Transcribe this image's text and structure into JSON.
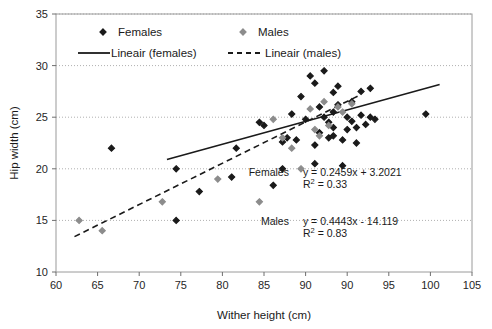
{
  "chart_data": {
    "type": "scatter",
    "title": "",
    "xlabel": "Wither height (cm)",
    "ylabel": "Hip width (cm)",
    "xlim": [
      60,
      105
    ],
    "ylim": [
      10,
      35
    ],
    "xticks": [
      60,
      65,
      70,
      75,
      80,
      85,
      90,
      90,
      95,
      100,
      105
    ],
    "yticks": [
      10,
      15,
      20,
      25,
      30,
      35
    ],
    "xtick_labels": [
      "60",
      "65",
      "70",
      "75",
      "80",
      "85",
      "90",
      "90",
      "95",
      "100",
      "105"
    ],
    "ytick_labels": [
      "10",
      "15",
      "20",
      "25",
      "30",
      "35"
    ],
    "grid": "horizontal-dotted",
    "legend_position": "top-inside",
    "legend": [
      {
        "label": "Females",
        "marker": "diamond",
        "color": "#1a1a1a"
      },
      {
        "label": "Males",
        "marker": "diamond",
        "color": "#8c8c8c"
      },
      {
        "label": "Lineair (females)",
        "marker": "solid-line",
        "color": "#1a1a1a"
      },
      {
        "label": "Lineair (males)",
        "marker": "dashed-line",
        "color": "#1a1a1a"
      }
    ],
    "series": [
      {
        "name": "Females",
        "marker": "diamond",
        "color": "#1a1a1a",
        "points": [
          [
            66.0,
            22.0
          ],
          [
            73.0,
            15.0
          ],
          [
            73.0,
            20.0
          ],
          [
            75.5,
            17.8
          ],
          [
            79.0,
            19.2
          ],
          [
            79.5,
            22.0
          ],
          [
            82.0,
            24.5
          ],
          [
            82.5,
            24.2
          ],
          [
            83.5,
            18.4
          ],
          [
            84.5,
            22.6
          ],
          [
            84.5,
            20.0
          ],
          [
            85.0,
            23.0
          ],
          [
            85.5,
            25.3
          ],
          [
            86.0,
            22.8
          ],
          [
            86.5,
            27.0
          ],
          [
            87.0,
            24.8
          ],
          [
            87.5,
            29.0
          ],
          [
            88.0,
            28.3
          ],
          [
            88.0,
            22.3
          ],
          [
            88.0,
            20.5
          ],
          [
            88.5,
            26.0
          ],
          [
            88.5,
            23.5
          ],
          [
            89.0,
            29.5
          ],
          [
            89.0,
            25.0
          ],
          [
            89.5,
            24.5
          ],
          [
            89.5,
            23.0
          ],
          [
            90.0,
            27.4
          ],
          [
            90.0,
            25.5
          ],
          [
            90.0,
            24.0
          ],
          [
            90.0,
            23.2
          ],
          [
            90.5,
            28.0
          ],
          [
            90.5,
            26.2
          ],
          [
            91.0,
            22.8
          ],
          [
            91.0,
            20.3
          ],
          [
            91.5,
            25.0
          ],
          [
            91.5,
            23.8
          ],
          [
            92.0,
            26.5
          ],
          [
            92.0,
            24.6
          ],
          [
            92.5,
            24.0
          ],
          [
            92.5,
            22.5
          ],
          [
            93.0,
            27.5
          ],
          [
            93.0,
            25.2
          ],
          [
            93.5,
            24.3
          ],
          [
            94.0,
            27.8
          ],
          [
            94.0,
            25.0
          ],
          [
            94.5,
            24.8
          ],
          [
            100.0,
            25.3
          ]
        ]
      },
      {
        "name": "Males",
        "marker": "diamond",
        "color": "#8c8c8c",
        "points": [
          [
            62.5,
            15.0
          ],
          [
            65.0,
            14.0
          ],
          [
            71.5,
            16.8
          ],
          [
            77.5,
            19.0
          ],
          [
            82.0,
            16.8
          ],
          [
            83.5,
            24.8
          ],
          [
            84.5,
            23.0
          ],
          [
            85.5,
            22.0
          ],
          [
            86.5,
            20.0
          ],
          [
            87.5,
            25.8
          ],
          [
            88.0,
            23.8
          ],
          [
            88.5,
            23.2
          ],
          [
            89.0,
            26.5
          ],
          [
            89.5,
            24.2
          ],
          [
            90.5,
            26.0
          ],
          [
            91.0,
            25.5
          ],
          [
            92.0,
            26.3
          ]
        ]
      }
    ],
    "trendlines": [
      {
        "name": "Lineair (females)",
        "style": "solid",
        "color": "#1a1a1a",
        "slope": 0.2459,
        "intercept": 3.2021,
        "r_squared": 0.33,
        "x_start": 72.0,
        "x_end": 101.5
      },
      {
        "name": "Lineair (males)",
        "style": "dashed",
        "color": "#1a1a1a",
        "slope": 0.4443,
        "intercept": -14.119,
        "r_squared": 0.83,
        "x_start": 62.0,
        "x_end": 93.0
      }
    ],
    "annotations": [
      {
        "id": "females-equation",
        "label": "Females",
        "equation": "y = 0.2459x + 3.2021",
        "r2_prefix": "R",
        "r2_sup": "2",
        "r2_value": " = 0.33",
        "x": 85.2,
        "y": 19.3
      },
      {
        "id": "males-equation",
        "label": "Males",
        "equation": "y = 0.4443x - 14.119",
        "r2_prefix": "R",
        "r2_sup": "2",
        "r2_value": " = 0.83",
        "x": 85.2,
        "y": 14.6
      }
    ]
  }
}
